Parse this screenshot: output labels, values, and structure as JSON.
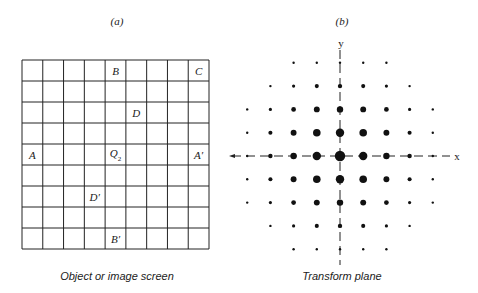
{
  "panel_a": {
    "title": "(a)",
    "caption": "Object or image screen",
    "grid": {
      "rows": 9,
      "cols": 9
    },
    "labels": [
      {
        "text": "B",
        "col": 4,
        "row": 0
      },
      {
        "text": "C",
        "col": 8,
        "row": 0
      },
      {
        "text": "D",
        "col": 5,
        "row": 2
      },
      {
        "text": "A",
        "col": 0,
        "row": 4
      },
      {
        "text": "Q",
        "sub": "2",
        "col": 4,
        "row": 4
      },
      {
        "text": "A′",
        "col": 8,
        "row": 4
      },
      {
        "text": "D′",
        "col": 3,
        "row": 6
      },
      {
        "text": "B′",
        "col": 4,
        "row": 8
      }
    ]
  },
  "panel_b": {
    "title": "(b)",
    "caption": "Transform plane",
    "x_axis_label": "x",
    "y_axis_label": "y",
    "spot_rows": [
      {
        "offset": -4,
        "cols": [
          -2,
          2
        ]
      },
      {
        "offset": -3,
        "cols": [
          -3,
          3
        ]
      },
      {
        "offset": -2,
        "cols": [
          -4,
          4
        ]
      },
      {
        "offset": -1,
        "cols": [
          -4,
          4
        ]
      },
      {
        "offset": 0,
        "cols": [
          -4,
          4
        ]
      },
      {
        "offset": 1,
        "cols": [
          -4,
          4
        ]
      },
      {
        "offset": 2,
        "cols": [
          -4,
          4
        ]
      },
      {
        "offset": 3,
        "cols": [
          -3,
          3
        ]
      },
      {
        "offset": 4,
        "cols": [
          -2,
          2
        ]
      }
    ]
  }
}
